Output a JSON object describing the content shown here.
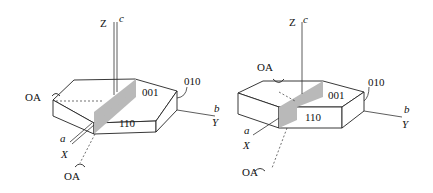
{
  "figure": {
    "panels": [
      {
        "id": "left",
        "axes": {
          "z": "Z",
          "c": "c",
          "x": "X",
          "a": "a",
          "y": "Y",
          "b": "b"
        },
        "faces": {
          "top": "001",
          "front": "110",
          "side": "010"
        },
        "optic_axes": [
          "OA",
          "OA"
        ]
      },
      {
        "id": "right",
        "axes": {
          "z": "Z",
          "c": "c",
          "x": "X",
          "a": "a",
          "y": "Y",
          "b": "b"
        },
        "faces": {
          "top": "001",
          "front": "110",
          "side": "010"
        },
        "optic_axes": [
          "OA",
          "OA"
        ]
      }
    ],
    "colors": {
      "shaded_plane": "#b9b9b9",
      "lines": "#222222"
    }
  }
}
